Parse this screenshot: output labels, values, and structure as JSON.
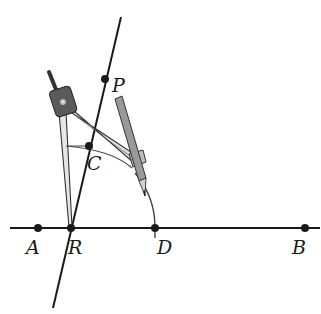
{
  "diagram": {
    "type": "geometric-construction",
    "colors": {
      "line": "#1a1a1a",
      "point": "#1a1a1a",
      "compass_body": "#d9d9d9",
      "compass_outline": "#333333",
      "compass_head": "#555555",
      "pencil": "#9a9a9a"
    },
    "labels": {
      "P": "P",
      "C": "C",
      "A": "A",
      "R": "R",
      "D": "D",
      "B": "B"
    },
    "points": [
      {
        "name": "P",
        "x": 105,
        "y": 79
      },
      {
        "name": "C",
        "x": 89,
        "y": 146
      },
      {
        "name": "A",
        "x": 38,
        "y": 228
      },
      {
        "name": "R",
        "x": 71,
        "y": 228
      },
      {
        "name": "D",
        "x": 155,
        "y": 228
      },
      {
        "name": "B",
        "x": 305,
        "y": 228
      }
    ],
    "lines": [
      {
        "name": "line-RP",
        "from": [
          121,
          17
        ],
        "to": [
          53,
          308
        ]
      },
      {
        "name": "line-AB",
        "from": [
          10,
          228
        ],
        "to": [
          320,
          228
        ]
      }
    ],
    "tools": [
      "compass-icon",
      "pencil-icon"
    ]
  }
}
